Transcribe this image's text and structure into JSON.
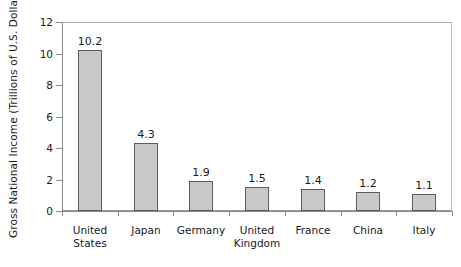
{
  "chart_data": {
    "type": "bar",
    "title": "",
    "xlabel": "",
    "ylabel": "Gross National Income (Trillions of U.S. Dollars)",
    "categories": [
      "United States",
      "Japan",
      "Germany",
      "United Kingdom",
      "France",
      "China",
      "Italy"
    ],
    "category_lines": [
      [
        "United",
        "States"
      ],
      [
        "Japan"
      ],
      [
        "Germany"
      ],
      [
        "United",
        "Kingdom"
      ],
      [
        "France"
      ],
      [
        "China"
      ],
      [
        "Italy"
      ]
    ],
    "values": [
      10.2,
      4.3,
      1.9,
      1.5,
      1.4,
      1.2,
      1.1
    ],
    "value_labels": [
      "10.2",
      "4.3",
      "1.9",
      "1.5",
      "1.4",
      "1.2",
      "1.1"
    ],
    "ylim": [
      0,
      12
    ],
    "yticks": [
      0,
      2,
      4,
      6,
      8,
      10,
      12
    ],
    "ytick_labels": [
      "0",
      "2",
      "4",
      "6",
      "8",
      "10",
      "12"
    ],
    "grid": false,
    "legend": null,
    "colors": {
      "bar_fill": "#c9c9c9",
      "bar_border": "#5d5d5d",
      "axis": "#8a8a8a",
      "frame": "#b0b0b0",
      "text": "#1a1a1a",
      "background": "#ffffff"
    }
  }
}
